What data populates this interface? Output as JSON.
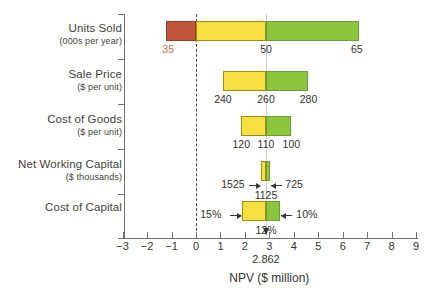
{
  "chart_data": {
    "type": "bar",
    "subtype": "tornado-sensitivity",
    "title": "",
    "xlabel": "NPV ($ million)",
    "ylabel": "",
    "xlim": [
      -3,
      9
    ],
    "xticks": [
      -3,
      -2,
      -1,
      0,
      1,
      2,
      3,
      4,
      5,
      6,
      7,
      8,
      9
    ],
    "xticklabels": [
      "−3",
      "−2",
      "−1",
      "0",
      "1",
      "2",
      "3",
      "4",
      "5",
      "6",
      "7",
      "8",
      "9"
    ],
    "grid": false,
    "legend": false,
    "base_case": {
      "value": 2.862,
      "label": "2.862"
    },
    "zero_line": 0,
    "categories": [
      {
        "name": "Units Sold",
        "unit": "(000s per year)",
        "npv_low": -1.22,
        "npv_base": 2.862,
        "npv_high": 6.66,
        "low_label": "35",
        "base_label": "50",
        "high_label": "65",
        "low_label_color": "#c0704a"
      },
      {
        "name": "Sale Price",
        "unit": "($ per unit)",
        "npv_low": 1.1,
        "npv_base": 2.862,
        "npv_high": 4.6,
        "low_label": "240",
        "base_label": "260",
        "high_label": "280"
      },
      {
        "name": "Cost of Goods",
        "unit": "($ per unit)",
        "npv_low": 1.85,
        "npv_base": 2.862,
        "npv_high": 3.9,
        "low_label": "120",
        "base_label": "110",
        "high_label": "100"
      },
      {
        "name": "Net Working Capital",
        "unit": "($ thousands)",
        "npv_low": 2.67,
        "npv_base": 2.862,
        "npv_high": 3.04,
        "low_label": "1525",
        "base_label": "1125",
        "high_label": "725"
      },
      {
        "name": "Cost of Capital",
        "unit": "",
        "npv_low": 1.89,
        "npv_base": 2.862,
        "npv_high": 3.45,
        "low_label": "15%",
        "base_label": "12%",
        "high_label": "10%"
      }
    ],
    "colors": {
      "low_negative": "#c0553b",
      "low_positive": "#f5e03f",
      "high": "#8cc63e",
      "zero_line": "#4a4a4a",
      "base_line": "#cfcfcf",
      "axis": "#6f6f6f"
    }
  }
}
